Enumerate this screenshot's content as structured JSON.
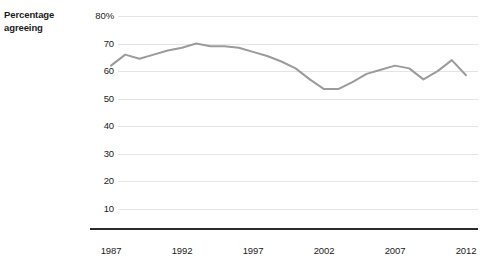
{
  "chart_data": {
    "type": "line",
    "title": "",
    "subtitle": "",
    "xlabel": "",
    "ylabel": "Percentage agreeing",
    "ylabel_lines": [
      "Percentage",
      "agreeing"
    ],
    "ylim": [
      0,
      80
    ],
    "xlim": [
      1987,
      2012
    ],
    "grid": true,
    "legend": false,
    "y_ticks": [
      80,
      70,
      60,
      50,
      40,
      30,
      20,
      10
    ],
    "y_tick_labels": [
      "80%",
      "70",
      "60",
      "50",
      "40",
      "30",
      "20",
      "10"
    ],
    "x_ticks": [
      1987,
      1992,
      1997,
      2002,
      2007,
      2012
    ],
    "x_tick_labels": [
      "1987",
      "1992",
      "1997",
      "2002",
      "2007",
      "2012"
    ],
    "series": [
      {
        "name": "Percentage agreeing",
        "color": "#9b9b9b",
        "x": [
          1987,
          1988,
          1989,
          1990,
          1991,
          1992,
          1993,
          1994,
          1995,
          1996,
          1997,
          1998,
          1999,
          2000,
          2001,
          2002,
          2003,
          2004,
          2005,
          2006,
          2007,
          2008,
          2009,
          2010,
          2011,
          2012
        ],
        "values": [
          62.0,
          66.0,
          64.5,
          66.0,
          67.5,
          68.5,
          70.0,
          69.0,
          69.0,
          68.5,
          67.0,
          65.5,
          63.5,
          61.0,
          57.0,
          53.5,
          53.5,
          56.0,
          59.0,
          60.5,
          62.0,
          61.0,
          57.0,
          60.0,
          64.0,
          58.5
        ]
      }
    ]
  },
  "axes": {
    "y_caption_line1": "Percentage",
    "y_caption_line2": "agreeing"
  }
}
